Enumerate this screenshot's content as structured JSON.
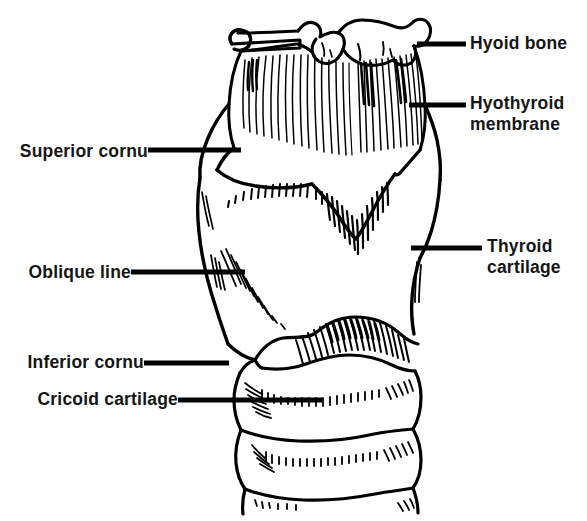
{
  "figure": {
    "background_color": "#ffffff",
    "ink_color": "#000000",
    "width": 587,
    "height": 521
  },
  "labels": {
    "hyoid_bone": "Hyoid bone",
    "hyothyroid_membrane_line1": "Hyothyroid",
    "hyothyroid_membrane_line2": "membrane",
    "thyroid_cartilage_line1": "Thyroid",
    "thyroid_cartilage_line2": "cartilage",
    "superior_cornu": "Superior cornu",
    "oblique_line": "Oblique line",
    "inferior_cornu": "Inferior cornu",
    "cricoid_cartilage": "Cricoid cartilage"
  },
  "leader_lines": [
    {
      "name": "leader-hyoid-bone",
      "x1": 417,
      "y1": 44,
      "x2": 466,
      "y2": 44
    },
    {
      "name": "leader-hyothyroid",
      "x1": 409,
      "y1": 105,
      "x2": 466,
      "y2": 105
    },
    {
      "name": "leader-thyroid-cartilage",
      "x1": 411,
      "y1": 248,
      "x2": 482,
      "y2": 248
    },
    {
      "name": "leader-superior-cornu",
      "x1": 148,
      "y1": 150,
      "x2": 241,
      "y2": 150
    },
    {
      "name": "leader-oblique-line",
      "x1": 131,
      "y1": 272,
      "x2": 245,
      "y2": 272
    },
    {
      "name": "leader-inferior-cornu",
      "x1": 144,
      "y1": 363,
      "x2": 229,
      "y2": 363
    },
    {
      "name": "leader-cricoid-cartilage",
      "x1": 178,
      "y1": 400,
      "x2": 322,
      "y2": 400
    }
  ],
  "structures": [
    {
      "name": "hyoid-bone",
      "description": "U-shaped bone at superior margin with greater and lesser cornua"
    },
    {
      "name": "hyothyroid-membrane",
      "description": "Vertically striated fibrous membrane between hyoid bone and thyroid cartilage"
    },
    {
      "name": "thyroid-cartilage",
      "description": "Large shield-shaped cartilage forming the body of the larynx"
    },
    {
      "name": "superior-cornu",
      "description": "Upper horn projection of the thyroid cartilage, left side"
    },
    {
      "name": "oblique-line",
      "description": "Ridge on lateral surface of thyroid cartilage lamina"
    },
    {
      "name": "inferior-cornu",
      "description": "Lower horn of thyroid cartilage articulating with cricoid"
    },
    {
      "name": "cricoid-cartilage",
      "description": "Ring-shaped cartilage below the thyroid cartilage"
    },
    {
      "name": "cricothyroid-region",
      "description": "Densely hatched band between thyroid and cricoid cartilages"
    },
    {
      "name": "tracheal-rings",
      "description": "Two stacked tracheal cartilage rings at the inferior aspect"
    }
  ]
}
